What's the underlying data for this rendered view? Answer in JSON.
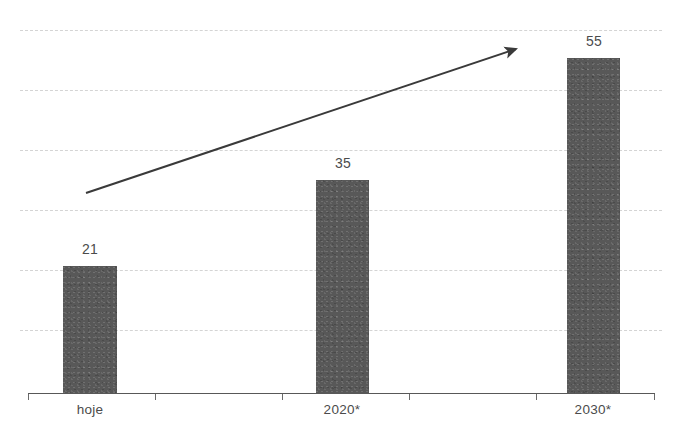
{
  "chart_data": {
    "type": "bar",
    "title": "",
    "subtitle": "",
    "xlabel": "",
    "ylabel": "",
    "categories": [
      "hoje",
      "2020*",
      "2030*"
    ],
    "values": [
      21,
      35,
      55
    ],
    "value_labels": [
      "21",
      "35",
      "55"
    ],
    "series": [
      {
        "name": "",
        "values": [
          21,
          35,
          55
        ]
      }
    ],
    "ylim": [
      0,
      66
    ],
    "grid": true,
    "grid_axis": "y",
    "gridline_count": 6,
    "legend": "none",
    "annotations": [
      {
        "type": "arrow",
        "name": "growth-trend-arrow",
        "text": "",
        "from": [
          86,
          193
        ],
        "to": [
          523,
          47
        ]
      }
    ]
  },
  "colors": {
    "background": "#ffffff",
    "bar": "#585858",
    "gridline": "#d4d4d4",
    "axis": "#585858",
    "label_text": "#4b4b4b",
    "arrow": "#3a3a3a"
  },
  "axis": {
    "ticks": [
      "",
      "",
      "",
      ""
    ]
  }
}
